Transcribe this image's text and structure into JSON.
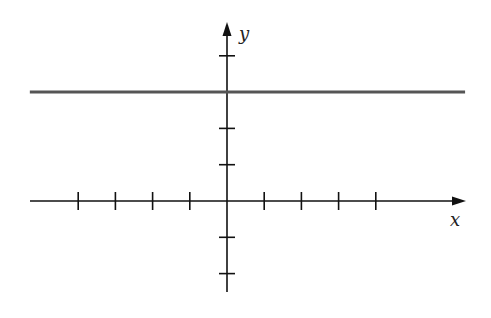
{
  "chart_data": {
    "type": "line",
    "title": "",
    "xlabel": "x",
    "ylabel": "y",
    "xlim": [
      -4,
      4
    ],
    "ylim": [
      -2,
      4
    ],
    "x_ticks": [
      -4,
      -3,
      -2,
      -1,
      1,
      2,
      3,
      4
    ],
    "y_ticks": [
      -2,
      -1,
      1,
      2,
      3,
      4
    ],
    "tick_labels_shown": false,
    "grid": false,
    "legend": null,
    "series": [
      {
        "name": "y = 3",
        "equation": "y = 3",
        "x": [
          -5.3,
          6.4
        ],
        "y": [
          3,
          3
        ],
        "color": "#555555"
      }
    ]
  },
  "colors": {
    "axis": "#111111",
    "line": "#555555",
    "background": "#ffffff"
  }
}
